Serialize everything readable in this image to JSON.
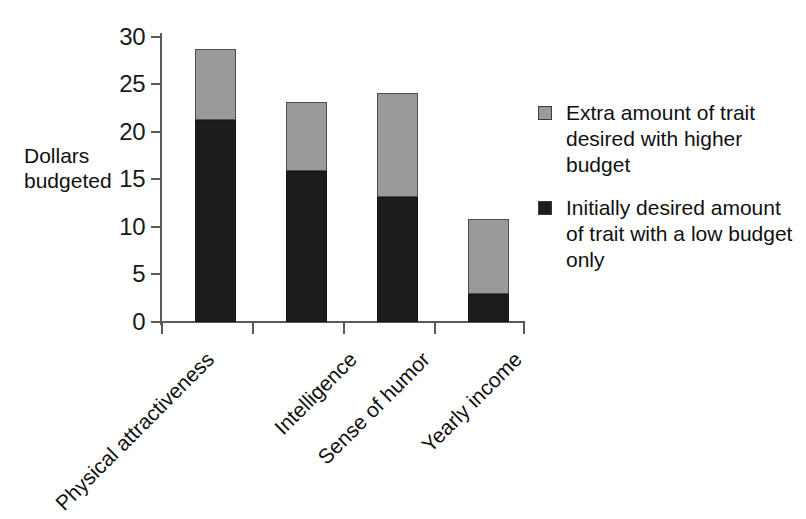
{
  "chart_data": {
    "type": "bar",
    "subtype": "stacked-vertical",
    "title": "",
    "xlabel": "",
    "ylabel": "Dollars budgeted",
    "ylabel_lines": [
      "Dollars",
      "budgeted"
    ],
    "ylim": [
      0,
      30
    ],
    "ytick_values": [
      0,
      5,
      10,
      15,
      20,
      25,
      30
    ],
    "ytick_labels": [
      "0",
      "5",
      "10",
      "15",
      "20",
      "25",
      "30"
    ],
    "grid": false,
    "legend_position": "right",
    "categories": [
      "Physical attractiveness",
      "Intelligence",
      "Sense of humor",
      "Yearly income"
    ],
    "series": [
      {
        "name": "Initially desired amount of trait with a low budget only",
        "key": "low_budget",
        "color": "#1c1c1c",
        "values": [
          21.3,
          15.9,
          13.2,
          2.9
        ]
      },
      {
        "name": "Extra amount of trait desired with higher budget",
        "key": "extra_budget",
        "color": "#9a9a9a",
        "values": [
          7.4,
          7.3,
          10.9,
          7.9
        ]
      }
    ],
    "totals": [
      28.7,
      23.2,
      24.1,
      10.8
    ]
  },
  "axis": {
    "y_title_line1": "Dollars",
    "y_title_line2": "budgeted",
    "ticks": [
      "30",
      "25",
      "20",
      "15",
      "10",
      "5",
      "0"
    ]
  },
  "categories": [
    {
      "label": "Physical attractiveness"
    },
    {
      "label": "Intelligence"
    },
    {
      "label": "Sense of humor"
    },
    {
      "label": "Yearly income"
    }
  ],
  "legend": {
    "items": [
      {
        "swatch": "extra",
        "color": "#9a9a9a",
        "label": "Extra amount of trait desired with higher budget"
      },
      {
        "swatch": "low",
        "color": "#1c1c1c",
        "label": "Initially desired amount of trait with a low budget only"
      }
    ]
  },
  "colors": {
    "extra_budget": "#9a9a9a",
    "low_budget": "#1c1c1c",
    "axis": "#5a5a5a",
    "text": "#111111",
    "background": "#ffffff"
  }
}
